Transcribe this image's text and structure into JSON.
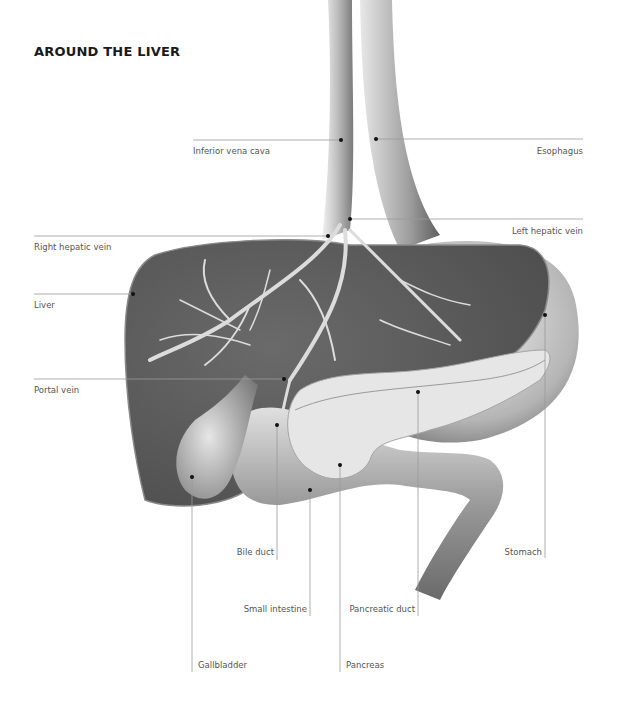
{
  "title": "AROUND THE LIVER",
  "labels": {
    "inferior_vena_cava": "Inferior vena cava",
    "esophagus": "Esophagus",
    "left_hepatic_vein": "Left hepatic vein",
    "right_hepatic_vein": "Right hepatic vein",
    "liver": "Liver",
    "portal_vein": "Portal vein",
    "bile_duct": "Bile duct",
    "stomach": "Stomach",
    "small_intestine": "Small intestine",
    "pancreatic_duct": "Pancreatic duct",
    "gallbladder": "Gallbladder",
    "pancreas": "Pancreas"
  },
  "colors": {
    "liver": "#5a5a5a",
    "organ_light": "#d9d9d9",
    "vessel": "#cfcfcf",
    "leader_line": "#9a9a9a",
    "dot": "#111111"
  }
}
